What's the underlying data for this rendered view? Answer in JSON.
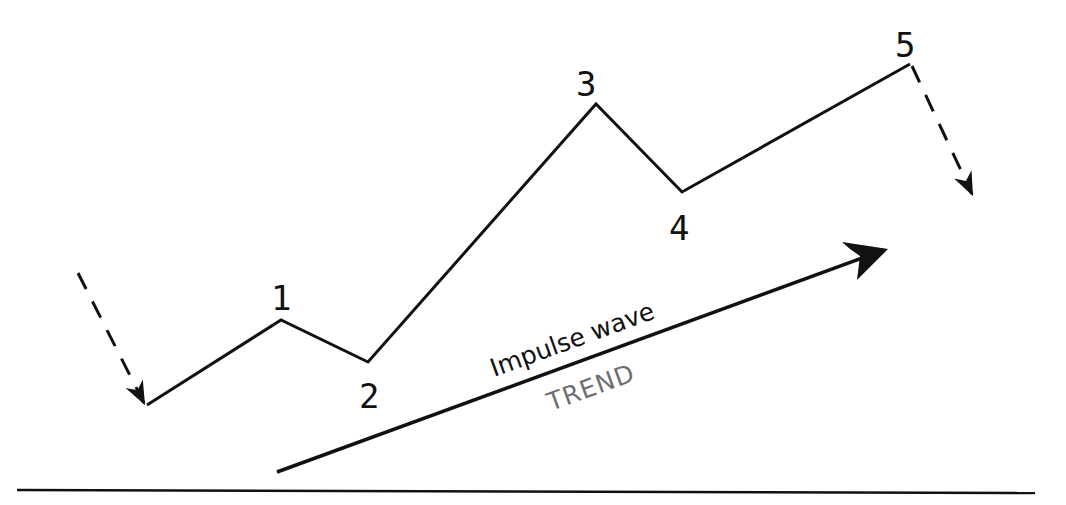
{
  "diagram": {
    "colors": {
      "line": "#111111",
      "trend_text": "#6e6e6e",
      "background": "#ffffff"
    },
    "wave_points": [
      {
        "label": "",
        "x": 147,
        "y": 405
      },
      {
        "label": "1",
        "x": 281,
        "y": 320
      },
      {
        "label": "2",
        "x": 368,
        "y": 362
      },
      {
        "label": "3",
        "x": 596,
        "y": 104
      },
      {
        "label": "4",
        "x": 682,
        "y": 192
      },
      {
        "label": "5",
        "x": 910,
        "y": 64
      }
    ],
    "labels": {
      "w1": "1",
      "w2": "2",
      "w3": "3",
      "w4": "4",
      "w5": "5",
      "impulse": "Impulse wave",
      "trend": "TREND"
    },
    "entry_arrow": {
      "from": [
        78,
        273
      ],
      "to": [
        144,
        405
      ],
      "style": "dashed"
    },
    "exit_arrow": {
      "from": [
        912,
        66
      ],
      "to": [
        973,
        196
      ],
      "style": "dashed"
    },
    "trend_arrow": {
      "from": [
        277,
        472
      ],
      "to": [
        888,
        249
      ],
      "style": "solid"
    },
    "baseline": {
      "from": [
        17,
        490
      ],
      "to": [
        1035,
        493
      ]
    }
  }
}
